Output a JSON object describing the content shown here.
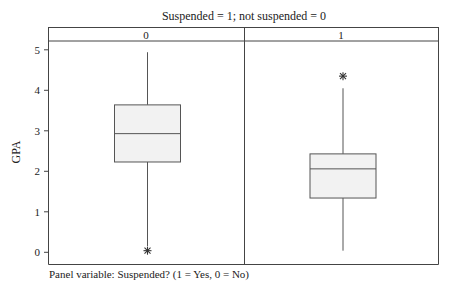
{
  "chart_data": {
    "type": "box",
    "title": "Suspended = 1; not suspended = 0",
    "xlabel": "",
    "ylabel": "GPA",
    "footer": "Panel variable: Suspended? (1 = Yes, 0 = No)",
    "ylim": [
      -0.3,
      5.2
    ],
    "yticks": [
      0,
      1,
      2,
      3,
      4,
      5
    ],
    "ytick_labels": [
      "0",
      "1",
      "2",
      "3",
      "4",
      "5"
    ],
    "grid": false,
    "legend": null,
    "panels": [
      {
        "label": "0",
        "whisker_low": 0.15,
        "q1": 2.23,
        "median": 2.93,
        "q3": 3.64,
        "whisker_high": 4.94,
        "outliers": [
          0.04
        ]
      },
      {
        "label": "1",
        "whisker_low": 0.04,
        "q1": 1.34,
        "median": 2.06,
        "q3": 2.43,
        "whisker_high": 4.05,
        "outliers": [
          4.35
        ]
      }
    ],
    "colors": {
      "box_fill": "#f2f2f2",
      "line": "#555555",
      "frame": "#444444"
    }
  }
}
